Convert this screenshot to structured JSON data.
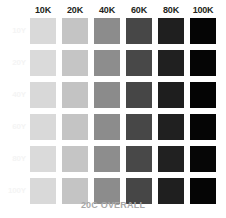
{
  "chart_data": {
    "type": "heatmap",
    "title": "",
    "subtitle": "",
    "caption": "20C OVERALL",
    "xlabel": "",
    "ylabel": "",
    "grid": false,
    "legend": "none",
    "categories": [
      "10K",
      "20K",
      "40K",
      "60K",
      "80K",
      "100K"
    ],
    "row_categories": [
      "10Y",
      "20Y",
      "40Y",
      "60Y",
      "80Y",
      "100Y"
    ],
    "x_values": [
      10,
      20,
      40,
      60,
      80,
      100
    ],
    "y_values": [
      10,
      20,
      40,
      60,
      80,
      100
    ],
    "cell_unit": "percent",
    "series": [
      {
        "name": "10Y",
        "values": [
          "#d9d9d9",
          "#c4c4c4",
          "#8c8c8c",
          "#474747",
          "#1f1f1f",
          "#050505"
        ]
      },
      {
        "name": "20Y",
        "values": [
          "#dadada",
          "#c5c5c5",
          "#8d8d8d",
          "#484848",
          "#202020",
          "#050505"
        ]
      },
      {
        "name": "40Y",
        "values": [
          "#d8d8d8",
          "#c3c3c3",
          "#8b8b8b",
          "#464646",
          "#1e1e1e",
          "#040404"
        ]
      },
      {
        "name": "60Y",
        "values": [
          "#d9d9d9",
          "#c4c4c4",
          "#8c8c8c",
          "#474747",
          "#202020",
          "#050505"
        ]
      },
      {
        "name": "80Y",
        "values": [
          "#dadada",
          "#c5c5c5",
          "#8d8d8d",
          "#484848",
          "#212121",
          "#060606"
        ]
      },
      {
        "name": "100Y",
        "values": [
          "#d9d9d9",
          "#c4c4c4",
          "#8c8c8c",
          "#464646",
          "#1f1f1f",
          "#050505"
        ]
      }
    ]
  },
  "colors": {
    "background": "#ffffff",
    "header_text": "#231f20",
    "row_label_text": "#f4f4f4",
    "caption_text": "#a8a8a8"
  }
}
